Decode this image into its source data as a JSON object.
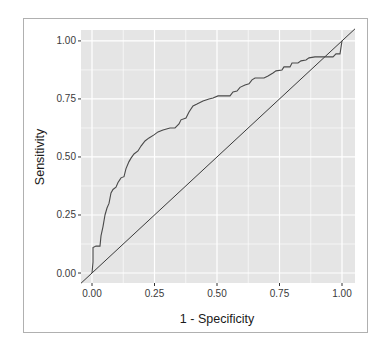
{
  "chart_data": {
    "type": "line",
    "title": "",
    "xlabel": "1 - Specificity",
    "ylabel": "Sensitivity",
    "xlim": [
      -0.044,
      1.052
    ],
    "ylim": [
      -0.043,
      1.047
    ],
    "grid": true,
    "legend": "none",
    "x_ticks": [
      0,
      0.25,
      0.5,
      0.75,
      1.0
    ],
    "x_tick_labels": [
      "0.00",
      "0.25",
      "0.50",
      "0.75",
      "1.00"
    ],
    "y_ticks": [
      0,
      0.25,
      0.5,
      0.75,
      1.0
    ],
    "y_tick_labels": [
      "0.00",
      "0.25",
      "0.50",
      "0.75",
      "1.00"
    ],
    "colors": {
      "panel_background": "#e5e5e5",
      "grid": "#ffffff",
      "line": "#4a4a4a",
      "reference_line": "#3a3a3a",
      "frame": "#b0b0b0"
    },
    "series": [
      {
        "name": "ROC curve",
        "x": [
          0,
          0.004,
          0.004,
          0.016,
          0.032,
          0.036,
          0.044,
          0.052,
          0.06,
          0.068,
          0.076,
          0.084,
          0.096,
          0.104,
          0.116,
          0.128,
          0.136,
          0.148,
          0.156,
          0.168,
          0.184,
          0.196,
          0.212,
          0.228,
          0.248,
          0.264,
          0.284,
          0.312,
          0.332,
          0.348,
          0.356,
          0.376,
          0.388,
          0.404,
          0.42,
          0.444,
          0.468,
          0.484,
          0.504,
          0.552,
          0.564,
          0.58,
          0.592,
          0.612,
          0.628,
          0.64,
          0.652,
          0.688,
          0.704,
          0.724,
          0.736,
          0.76,
          0.768,
          0.792,
          0.8,
          0.824,
          0.836,
          0.856,
          0.868,
          0.892,
          0.908,
          0.964,
          0.976,
          0.992,
          1.0
        ],
        "y": [
          0,
          0.047,
          0.11,
          0.116,
          0.116,
          0.16,
          0.2,
          0.25,
          0.28,
          0.3,
          0.345,
          0.36,
          0.37,
          0.39,
          0.41,
          0.415,
          0.45,
          0.48,
          0.495,
          0.513,
          0.526,
          0.547,
          0.569,
          0.582,
          0.595,
          0.608,
          0.616,
          0.625,
          0.625,
          0.642,
          0.66,
          0.668,
          0.694,
          0.72,
          0.728,
          0.741,
          0.75,
          0.754,
          0.763,
          0.763,
          0.78,
          0.784,
          0.8,
          0.81,
          0.815,
          0.832,
          0.84,
          0.84,
          0.849,
          0.862,
          0.871,
          0.875,
          0.888,
          0.888,
          0.905,
          0.905,
          0.914,
          0.918,
          0.927,
          0.931,
          0.931,
          0.931,
          0.944,
          0.944,
          1.0
        ]
      },
      {
        "name": "Reference (chance) line",
        "x": [
          -0.044,
          1.052
        ],
        "y": [
          -0.044,
          1.052
        ]
      }
    ]
  }
}
